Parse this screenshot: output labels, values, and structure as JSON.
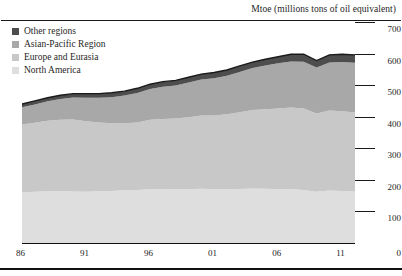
{
  "chart": {
    "title": "Mtoe (millions tons of oil equivalent)"
  },
  "legend": {
    "items": [
      {
        "label": "Other regions",
        "color": "#4d4d4d",
        "swatch_name": "legend-swatch-other-regions"
      },
      {
        "label": "Asian-Pacific Region",
        "color": "#a8a8a8",
        "swatch_name": "legend-swatch-asian-pacific-region"
      },
      {
        "label": "Europe and Eurasia",
        "color": "#c8c8c8",
        "swatch_name": "legend-swatch-europe-and-eurasia"
      },
      {
        "label": "North America",
        "color": "#dedede",
        "swatch_name": "legend-swatch-north-america"
      }
    ]
  },
  "axes": {
    "y_ticks": [
      "700",
      "600",
      "500",
      "400",
      "300",
      "200",
      "100",
      "0"
    ],
    "x_ticks": [
      "86",
      "91",
      "96",
      "01",
      "06",
      "11"
    ]
  },
  "chart_data": {
    "type": "area",
    "stacked": true,
    "title": "Mtoe (millions tons of oil equivalent)",
    "xlabel": "",
    "ylabel": "Mtoe (millions tons of oil equivalent)",
    "ylim": [
      0,
      700
    ],
    "ytick_interval": 100,
    "grid": true,
    "legend_position": "top-left",
    "x": [
      1986,
      1987,
      1988,
      1989,
      1990,
      1991,
      1992,
      1993,
      1994,
      1995,
      1996,
      1997,
      1998,
      1999,
      2000,
      2001,
      2002,
      2003,
      2004,
      2005,
      2006,
      2007,
      2008,
      2009,
      2010,
      2011,
      2012
    ],
    "xtick_labels": [
      "86",
      "91",
      "96",
      "01",
      "06",
      "11"
    ],
    "xtick_values": [
      1986,
      1991,
      1996,
      2001,
      2006,
      2011
    ],
    "series": [
      {
        "name": "North America",
        "color": "#dedede",
        "values": [
          160,
          162,
          164,
          164,
          163,
          162,
          164,
          165,
          167,
          168,
          170,
          171,
          170,
          170,
          172,
          170,
          170,
          171,
          173,
          172,
          170,
          171,
          168,
          162,
          166,
          165,
          163
        ]
      },
      {
        "name": "Europe and Eurasia",
        "color": "#c8c8c8",
        "values": [
          215,
          219,
          223,
          226,
          228,
          224,
          218,
          214,
          212,
          214,
          220,
          222,
          224,
          228,
          232,
          234,
          238,
          243,
          248,
          252,
          256,
          258,
          258,
          248,
          254,
          252,
          250
        ]
      },
      {
        "name": "Asian-Pacific Region",
        "color": "#a8a8a8",
        "values": [
          55,
          58,
          62,
          66,
          70,
          74,
          78,
          83,
          88,
          93,
          98,
          102,
          105,
          110,
          114,
          118,
          122,
          128,
          133,
          138,
          143,
          146,
          148,
          146,
          152,
          156,
          158
        ]
      },
      {
        "name": "Other regions",
        "color": "#4d4d4d",
        "values": [
          10,
          11,
          11,
          12,
          12,
          13,
          13,
          14,
          14,
          15,
          15,
          16,
          16,
          17,
          17,
          18,
          18,
          19,
          19,
          20,
          21,
          23,
          24,
          22,
          24,
          25,
          25
        ]
      }
    ],
    "totals": [
      440,
      450,
      460,
      468,
      473,
      473,
      473,
      476,
      481,
      490,
      503,
      511,
      515,
      525,
      535,
      540,
      548,
      561,
      573,
      582,
      590,
      598,
      598,
      578,
      596,
      598,
      596
    ],
    "total_line_color": "#1a1a1a"
  }
}
